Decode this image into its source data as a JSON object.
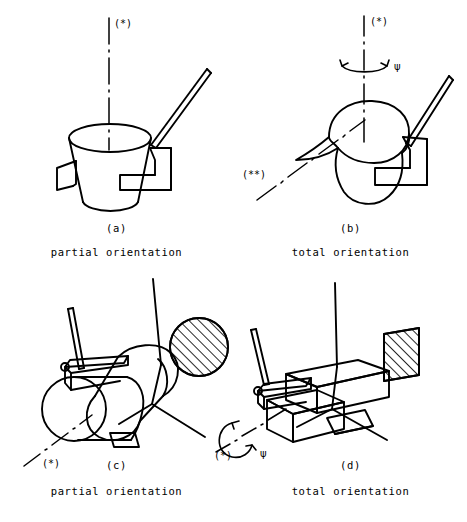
{
  "figure": {
    "type": "technical-line-drawing",
    "background_color": "#ffffff",
    "stroke_color": "#000000",
    "layout": "2x2 grid of orientation diagrams",
    "panels": [
      {
        "id": "a",
        "index_label": "(a)",
        "caption": "partial orientation",
        "part": "conical cup",
        "axis_labels": [
          "(*)"
        ],
        "rotation_symbol": null,
        "hatched_section": null
      },
      {
        "id": "b",
        "index_label": "(b)",
        "caption": "total orientation",
        "part": "pitcher with spout",
        "axis_labels": [
          "(*)",
          "(**)"
        ],
        "rotation_symbol": "ψ",
        "hatched_section": null
      },
      {
        "id": "c",
        "index_label": "(c)",
        "caption": "partial orientation",
        "part": "cylinder on chute",
        "axis_labels": [
          "(*)"
        ],
        "rotation_symbol": null,
        "hatched_section": "hatched circle"
      },
      {
        "id": "d",
        "index_label": "(d)",
        "caption": "total orientation",
        "part": "rectangular block on chute",
        "axis_labels": [
          "(*)"
        ],
        "rotation_symbol": "ψ",
        "hatched_section": "hatched parallelogram"
      }
    ]
  }
}
